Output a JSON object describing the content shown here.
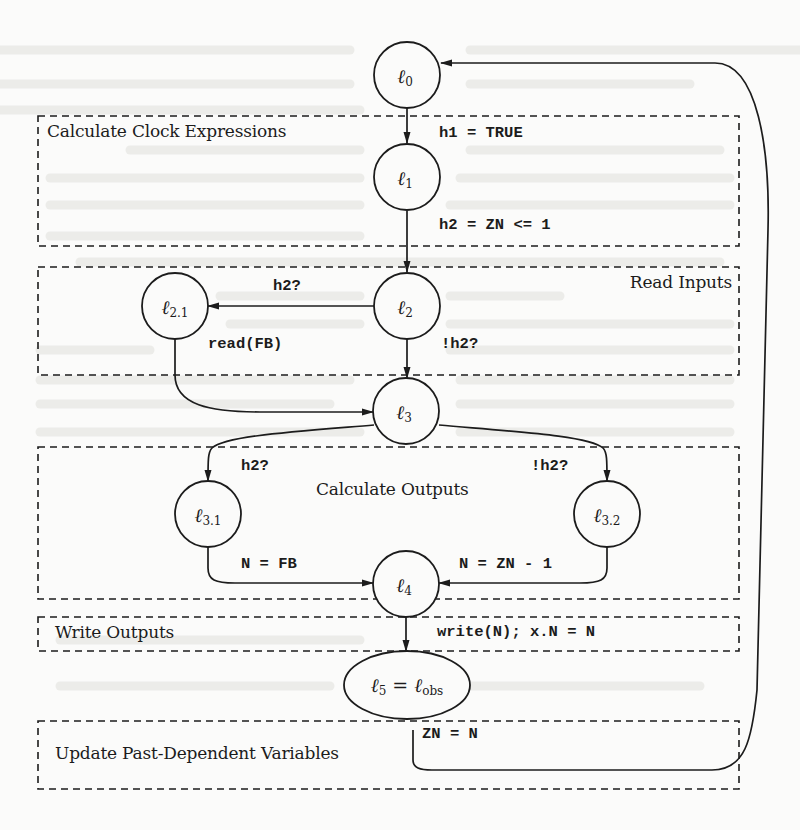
{
  "colors": {
    "ink": "#1c1c1c",
    "paper": "#fbfbfa",
    "ghost_text": "#e6e6e4"
  },
  "regions": [
    {
      "id": "calc-clock",
      "label": "Calculate Clock Expressions"
    },
    {
      "id": "read-inputs",
      "label": "Read Inputs"
    },
    {
      "id": "calc-outputs",
      "label": "Calculate Outputs"
    },
    {
      "id": "write-outputs",
      "label": "Write Outputs"
    },
    {
      "id": "update-past",
      "label": "Update Past-Dependent Variables"
    }
  ],
  "nodes": {
    "l0": {
      "base": "ℓ",
      "sub": "0"
    },
    "l1": {
      "base": "ℓ",
      "sub": "1"
    },
    "l2": {
      "base": "ℓ",
      "sub": "2"
    },
    "l21": {
      "base": "ℓ",
      "sub": "2.1"
    },
    "l3": {
      "base": "ℓ",
      "sub": "3"
    },
    "l31": {
      "base": "ℓ",
      "sub": "3.1"
    },
    "l32": {
      "base": "ℓ",
      "sub": "3.2"
    },
    "l4": {
      "base": "ℓ",
      "sub": "4"
    },
    "l5": {
      "base": "ℓ",
      "sub": "5",
      "eq": " = ",
      "base2": "ℓ",
      "sub2": "obs"
    }
  },
  "edges": {
    "l0_l1": "h1 = TRUE",
    "l1_l2": "h2 = ZN <= 1",
    "l2_l21": "h2?",
    "l2_l3": "!h2?",
    "l21_l3": "read(FB)",
    "l3_l31": "h2?",
    "l3_l32": "!h2?",
    "l31_l4": "N = FB",
    "l32_l4": "N = ZN - 1",
    "l4_l5": "write(N); x.N = N",
    "l5_l0": "ZN = N"
  }
}
